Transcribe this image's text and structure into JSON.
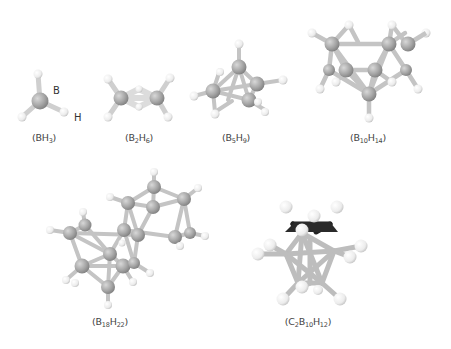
{
  "figure": {
    "colors": {
      "boron": "#a9a9a9",
      "hydrogen": "#f2f2f2",
      "carbon": "#2a2a2a",
      "bond": "#c8c8c8",
      "label_text": "#444444"
    },
    "atom_labels": {
      "boron": "B",
      "hydrogen": "H"
    },
    "molecules": [
      {
        "id": "BH3",
        "label_parts": [
          "(BH",
          "3",
          ")"
        ],
        "formula": "(BH3)"
      },
      {
        "id": "B2H6",
        "label_parts": [
          "(B",
          "2",
          "H",
          "6",
          ")"
        ],
        "formula": "(B2H6)"
      },
      {
        "id": "B5H9",
        "label_parts": [
          "(B",
          "5",
          "H",
          "9",
          ")"
        ],
        "formula": "(B5H9)"
      },
      {
        "id": "B10H14",
        "label_parts": [
          "(B",
          "10",
          "H",
          "14",
          ")"
        ],
        "formula": "(B10H14)"
      },
      {
        "id": "B18H22",
        "label_parts": [
          "(B",
          "18",
          "H",
          "22",
          ")"
        ],
        "formula": "(B18H22)"
      },
      {
        "id": "C2B10H12",
        "label_parts": [
          "(C",
          "2",
          "B",
          "10",
          "H",
          "12",
          ")"
        ],
        "formula": "(C2B10H12)"
      }
    ]
  }
}
